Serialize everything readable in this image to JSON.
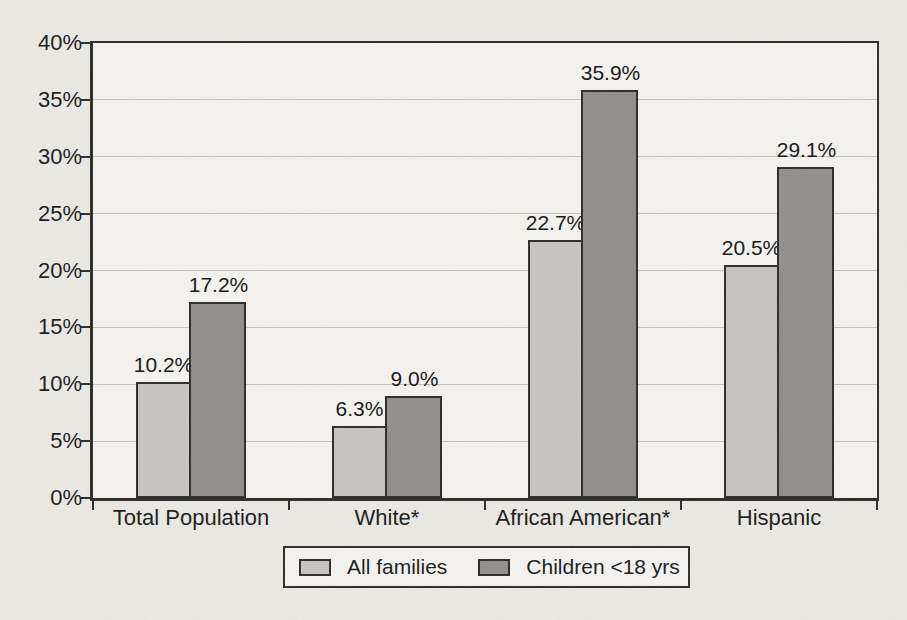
{
  "chart_data": {
    "type": "bar",
    "title": "",
    "xlabel": "",
    "ylabel": "",
    "categories": [
      "Total Population",
      "White*",
      "African American*",
      "Hispanic"
    ],
    "series": [
      {
        "name": "All families",
        "values": [
          10.2,
          6.3,
          22.7,
          20.5
        ],
        "labels": [
          "10.2%",
          "6.3%",
          "22.7%",
          "20.5%"
        ],
        "color": "#c6c5c2"
      },
      {
        "name": "Children <18 yrs",
        "values": [
          17.2,
          9.0,
          35.9,
          29.1
        ],
        "labels": [
          "17.2%",
          "9.0%",
          "35.9%",
          "29.1%"
        ],
        "color": "#908f8d"
      }
    ],
    "ylim": [
      0,
      40
    ],
    "ytick_step": 5,
    "yticks": [
      "0%",
      "5%",
      "10%",
      "15%",
      "20%",
      "25%",
      "30%",
      "35%",
      "40%"
    ],
    "grid": true,
    "legend_position": "bottom-center",
    "colors": {
      "axis": "#2d2c2a",
      "grid": "#c3c2bd",
      "page_bg": "#eae9e4",
      "plot_bg": "#f4f3ef",
      "text": "#1b1b1b"
    }
  }
}
